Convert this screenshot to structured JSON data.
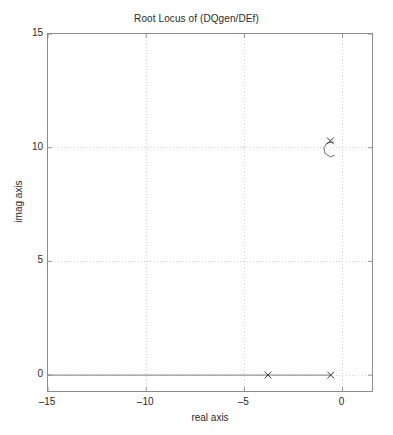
{
  "chart_data": {
    "type": "scatter",
    "title": "Root Locus of (DQgen/DEf)",
    "xlabel": "real axis",
    "ylabel": "imag axis",
    "xlim": [
      -15,
      1.5
    ],
    "ylim": [
      -0.7,
      15
    ],
    "grid": true,
    "legend": "none",
    "xticks": [
      -15,
      -10,
      -5,
      0
    ],
    "yticks": [
      0,
      5,
      10,
      15
    ],
    "xtick_labels": [
      "–15",
      "–10",
      "–5",
      "0"
    ],
    "ytick_labels": [
      "0",
      "5",
      "10",
      "15"
    ],
    "series": [
      {
        "name": "poles",
        "marker": "x",
        "color": "#3a3a3a",
        "points": [
          {
            "real": -3.8,
            "imag": 0.0
          },
          {
            "real": -0.6,
            "imag": 0.0
          },
          {
            "real": -0.62,
            "imag": 10.3
          }
        ]
      },
      {
        "name": "real-axis-locus-branch",
        "style": "line",
        "color": "#6e6e6e",
        "points": [
          {
            "real": -15.0,
            "imag": 0.0
          },
          {
            "real": -0.6,
            "imag": 0.0
          }
        ]
      },
      {
        "name": "complex-locus-arc",
        "style": "line",
        "color": "#5a5a5a",
        "points": [
          {
            "real": -0.45,
            "imag": 10.25
          },
          {
            "real": -0.78,
            "imag": 10.22
          },
          {
            "real": -0.95,
            "imag": 10.0
          },
          {
            "real": -0.9,
            "imag": 9.75
          },
          {
            "real": -0.62,
            "imag": 9.6
          },
          {
            "real": -0.42,
            "imag": 9.66
          }
        ]
      }
    ]
  },
  "axes": {
    "title": "Root Locus of (DQgen/DEf)",
    "x_label": "real axis",
    "y_label": "imag axis"
  }
}
